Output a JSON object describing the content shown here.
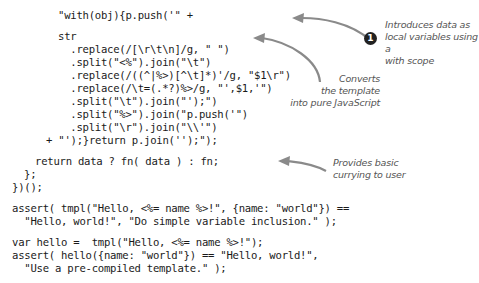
{
  "code_lines": [
    {
      "text": "\"with(obj){p.push('\" +",
      "x": 58,
      "y": 9
    },
    {
      "text": "str",
      "x": 58,
      "y": 30
    },
    {
      "text": "  .replace(/[\\r\\t\\n]/g, \" \")",
      "x": 58,
      "y": 43
    },
    {
      "text": "  .split(\"<%\").join(\"\\t\")",
      "x": 58,
      "y": 56
    },
    {
      "text": "  .replace(/((^|%>)[^\\t]*)'/g, \"$1\\r\")",
      "x": 58,
      "y": 69
    },
    {
      "text": "  .replace(/\\t=(.*?)%>/g, \"',$1,'\")",
      "x": 58,
      "y": 82
    },
    {
      "text": "  .split(\"\\t\").join(\"');\")",
      "x": 58,
      "y": 95
    },
    {
      "text": "  .split(\"%>\").join(\"p.push('\")",
      "x": 58,
      "y": 108
    },
    {
      "text": "  .split(\"\\r\").join(\"\\\\'\")",
      "x": 58,
      "y": 121
    },
    {
      "text": "+ \"');}return p.join('');\");",
      "x": 46,
      "y": 134
    },
    {
      "text": "return data ? fn( data ) : fn;",
      "x": 35,
      "y": 155
    },
    {
      "text": "};",
      "x": 24,
      "y": 168
    },
    {
      "text": "})();",
      "x": 12,
      "y": 181
    },
    {
      "text": "assert( tmpl(\"Hello, <%= name %>!\", {name: \"world\"}) ==",
      "x": 12,
      "y": 202
    },
    {
      "text": "  \"Hello, world!\", \"Do simple variable inclusion.\" );",
      "x": 12,
      "y": 215
    },
    {
      "text": "var hello =  tmpl(\"Hello, <%= name %>!\");",
      "x": 12,
      "y": 236
    },
    {
      "text": "assert( hello({name: \"world\"}) == \"Hello, world!\",",
      "x": 12,
      "y": 249
    },
    {
      "text": "  \"Use a pre-compiled template.\" );",
      "x": 12,
      "y": 262
    }
  ],
  "annotations": {
    "badge": "1",
    "note1": [
      "Introduces data as",
      "local variables using a",
      "with scope"
    ],
    "note2": [
      "Converts",
      "the template",
      "into pure JavaScript"
    ],
    "note3": [
      "Provides basic",
      "currying to user"
    ]
  },
  "colors": {
    "arrow": "#888888",
    "note_text": "#555555",
    "badge_bg": "#222222"
  }
}
